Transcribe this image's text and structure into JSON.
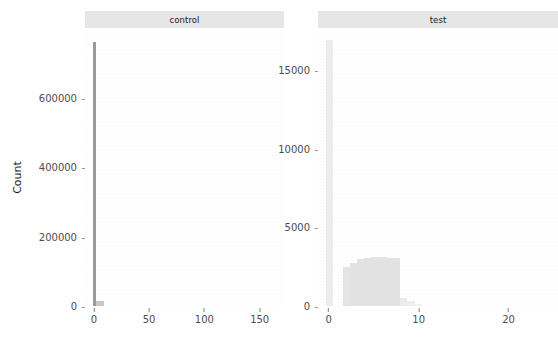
{
  "chart_data": {
    "type": "bar",
    "chart_kind": "faceted-histogram",
    "title": "",
    "subtitle": "",
    "xlabel": "",
    "ylabel": "Count",
    "grid": false,
    "legend": null,
    "legend_position": "none",
    "facet_variable": "group",
    "facet_scales": "free",
    "panels": [
      {
        "name": "control",
        "strip_label": "control",
        "xlabel": "",
        "ylabel": "Count",
        "xlim": [
          -8,
          172
        ],
        "ylim": [
          0,
          790000
        ],
        "xticks": [
          0,
          50,
          100,
          150
        ],
        "xtick_labels": [
          "0",
          "50",
          "100",
          "150"
        ],
        "yticks": [
          0,
          200000,
          400000,
          600000
        ],
        "ytick_labels": [
          "0",
          "200000",
          "400000",
          "600000"
        ],
        "bars": [
          {
            "x0": -1.0,
            "x1": 2.0,
            "value": 760000,
            "color": "#9a9a9a"
          },
          {
            "x0": 2.0,
            "x1": 9.0,
            "value": 14000,
            "color": "#c8c8c8"
          }
        ]
      },
      {
        "name": "test",
        "strip_label": "test",
        "xlabel": "",
        "ylabel": "Count",
        "xlim": [
          -1.2,
          25.5
        ],
        "ylim": [
          0,
          17400
        ],
        "xticks": [
          0,
          10,
          20
        ],
        "xtick_labels": [
          "0",
          "10",
          "20"
        ],
        "yticks": [
          0,
          5000,
          10000,
          15000
        ],
        "ytick_labels": [
          "0",
          "5000",
          "10000",
          "15000"
        ],
        "bars": [
          {
            "x0": -0.35,
            "x1": 0.45,
            "value": 16900,
            "color": "#ececec"
          },
          {
            "x0": 1.55,
            "x1": 2.35,
            "value": 2450,
            "color": "#e4e4e4"
          },
          {
            "x0": 2.35,
            "x1": 3.15,
            "value": 2750,
            "color": "#e2e2e2"
          },
          {
            "x0": 3.15,
            "x1": 3.95,
            "value": 3000,
            "color": "#e2e2e2"
          },
          {
            "x0": 3.95,
            "x1": 4.75,
            "value": 3050,
            "color": "#e2e2e2"
          },
          {
            "x0": 4.75,
            "x1": 5.55,
            "value": 3100,
            "color": "#e2e2e2"
          },
          {
            "x0": 5.55,
            "x1": 6.35,
            "value": 3100,
            "color": "#e2e2e2"
          },
          {
            "x0": 6.35,
            "x1": 7.15,
            "value": 3050,
            "color": "#e2e2e2"
          },
          {
            "x0": 7.15,
            "x1": 7.95,
            "value": 3050,
            "color": "#e2e2e2"
          },
          {
            "x0": 7.95,
            "x1": 8.75,
            "value": 520,
            "color": "#eaeaea"
          },
          {
            "x0": 8.75,
            "x1": 9.55,
            "value": 300,
            "color": "#eeeeee"
          },
          {
            "x0": 9.55,
            "x1": 10.35,
            "value": 150,
            "color": "#f1f1f1"
          }
        ]
      }
    ]
  },
  "theme": {
    "background": "#ffffff",
    "strip_background": "#e6e6e6",
    "text_color": "#4d4d4d",
    "axis_title_color": "#1a1a1a",
    "tick_color": "#808080"
  }
}
